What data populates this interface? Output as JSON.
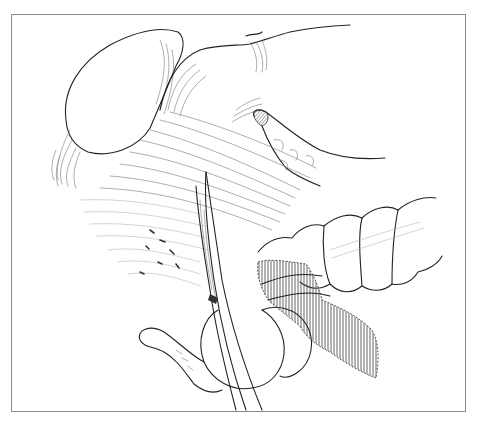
{
  "illustration": {
    "kind": "surgical anatomical line drawing",
    "frame_color": "#8a8a8a",
    "background": "#ffffff",
    "line_color": "#222222",
    "shading_color": "#666666",
    "elements": [
      {
        "id": "stomach-left-lobe",
        "label": ""
      },
      {
        "id": "stomach-body",
        "label": ""
      },
      {
        "id": "mesentery-fibers",
        "label": ""
      },
      {
        "id": "pancreas-tail",
        "label": ""
      },
      {
        "id": "transverse-colon",
        "label": ""
      },
      {
        "id": "hatched-vessel-segment",
        "label": ""
      },
      {
        "id": "surgical-instrument",
        "label": ""
      },
      {
        "id": "small-bowel-loop",
        "label": ""
      }
    ]
  }
}
